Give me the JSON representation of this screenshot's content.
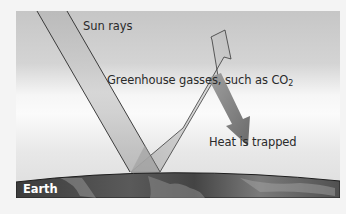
{
  "diagram": {
    "labels": {
      "sun_rays": "Sun rays",
      "greenhouse_prefix": "Greenhouse gasses, such as CO",
      "greenhouse_subscript": "2",
      "heat_trapped": "Heat is trapped",
      "earth": "Earth"
    },
    "colors": {
      "sky_top": "#c4c4c4",
      "sky_band": "#fafafa",
      "sky_bottom": "#d2d2d2",
      "ray_fill": "#bdbdbd",
      "ray_outline": "#2b2b2b",
      "earth_dark": "#3a3a3a",
      "earth_light": "#8a8a8a",
      "page_bg": "#f4f4f4"
    },
    "elements": [
      {
        "name": "incoming-sun-ray",
        "direction": "down-right"
      },
      {
        "name": "reflected-ray-arrow",
        "direction": "up-right"
      },
      {
        "name": "trapped-heat-arrow",
        "direction": "down-right"
      },
      {
        "name": "earth-surface"
      }
    ]
  }
}
